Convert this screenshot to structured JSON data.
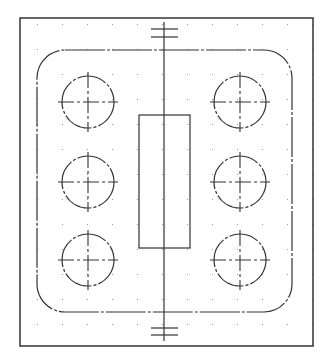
{
  "drawing": {
    "type": "cad-plate-drawing",
    "background": "#ffffff",
    "line_color": "#333333",
    "grid_color": "#9a9a9a",
    "grid": {
      "spacing": 25,
      "origin_x": 37,
      "origin_y": 24
    },
    "outer_border": {
      "x": 20,
      "y": 18,
      "width": 293,
      "height": 328
    },
    "rounded_plate": {
      "x": 37,
      "y": 50,
      "width": 255,
      "height": 262,
      "radius": 28
    },
    "center_slot": {
      "x": 139,
      "y": 115,
      "width": 51,
      "height": 133
    },
    "centerline": {
      "x": 164,
      "y1": 22,
      "y2": 341
    },
    "top_marker": {
      "x1": 151,
      "x2": 178,
      "y_lines": [
        29,
        37
      ]
    },
    "bottom_marker": {
      "x1": 151,
      "x2": 178,
      "y_lines": [
        328,
        335
      ]
    },
    "holes": [
      {
        "cx": 88,
        "cy": 102,
        "r": 26
      },
      {
        "cx": 240,
        "cy": 102,
        "r": 26
      },
      {
        "cx": 88,
        "cy": 182,
        "r": 26
      },
      {
        "cx": 240,
        "cy": 182,
        "r": 26
      },
      {
        "cx": 88,
        "cy": 260,
        "r": 26
      },
      {
        "cx": 240,
        "cy": 260,
        "r": 26
      }
    ]
  }
}
